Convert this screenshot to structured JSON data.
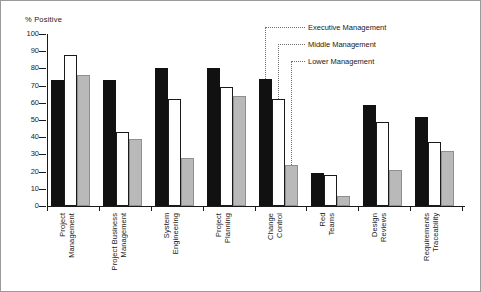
{
  "chart_data": {
    "type": "bar",
    "title": "",
    "subtitle": "",
    "xlabel": "",
    "ylabel": "% Positive",
    "ylim": [
      0,
      100
    ],
    "yticks": [
      0,
      10,
      20,
      30,
      40,
      50,
      60,
      70,
      80,
      90,
      100
    ],
    "ytick_labels": [
      "0",
      "10",
      "20",
      "30",
      "40",
      "50",
      "60",
      "70",
      "80",
      "90",
      "100"
    ],
    "grid": false,
    "legend_position": "top-right",
    "categories": [
      "Project\nManagement",
      "Project Business\nManagement",
      "System\nEngineering",
      "Project\nPlanning",
      "Change\nControl",
      "Red\nTeams",
      "Design\nReviews",
      "Requirements\nTraceability"
    ],
    "series": [
      {
        "name": "Executive Management",
        "color": "#111111",
        "values": [
          73,
          73,
          80,
          80,
          74,
          19,
          59,
          52
        ]
      },
      {
        "name": "Middle Management",
        "color": "#ffffff",
        "values": [
          88,
          43,
          62,
          69,
          62,
          18,
          49,
          37
        ]
      },
      {
        "name": "Lower Management",
        "color": "#b9b9b9",
        "values": [
          76,
          39,
          28,
          64,
          24,
          6,
          21,
          32
        ]
      }
    ],
    "annotations": [
      {
        "text": "Executive Management",
        "points_to": "Change Control / Executive Management bar"
      },
      {
        "text": "Middle Management",
        "points_to": "Change Control / Middle Management bar"
      },
      {
        "text": "Lower Management",
        "points_to": "Change Control / Lower Management bar"
      }
    ]
  }
}
